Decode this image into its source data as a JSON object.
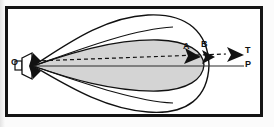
{
  "figure": {
    "type": "acoustic-beam-pattern-diagram",
    "frame": {
      "border_color": "#141414",
      "background_color": "#ffffff"
    },
    "source": {
      "label": "O",
      "icon": "transducer-horn-icon",
      "description": "point source with horn / transducer emitting beam"
    },
    "lobes": [
      {
        "name": "outer-lobe",
        "fill": "#ffffff",
        "stroke": "#111111",
        "label": ""
      },
      {
        "name": "inner-lobe",
        "fill": "#d4d4d4",
        "stroke": "#111111",
        "label": ""
      }
    ],
    "axis": {
      "name": "horizontal-axis",
      "stroke": "#2a2a2a",
      "end_label": "P"
    },
    "dashed_ray": {
      "name": "dashed-beam-axis",
      "stroke": "#111111",
      "style": "dashed",
      "end_label": "T"
    },
    "markers": [
      {
        "label": "A",
        "icon": "arrowhead-icon"
      },
      {
        "label": "B",
        "icon": "arrowhead-icon"
      },
      {
        "label": "T",
        "icon": "arrowhead-icon"
      }
    ],
    "labels": {
      "origin": "O",
      "point_a": "A",
      "point_b": "B",
      "axis_t": "T",
      "axis_p": "P"
    }
  }
}
